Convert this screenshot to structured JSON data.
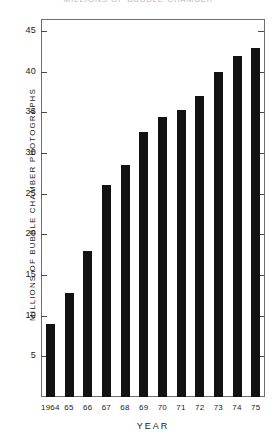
{
  "chart_data": {
    "type": "bar",
    "title": "MILLIONS OF BUBBLE CHAMBER",
    "xlabel": "YEAR",
    "ylabel": "MILLIONS OF BUBBLE CHAMBER PHOTOGRAPHS",
    "categories": [
      "1964",
      "65",
      "66",
      "67",
      "68",
      "69",
      "70",
      "71",
      "72",
      "73",
      "74",
      "75"
    ],
    "values": [
      9.0,
      12.8,
      17.9,
      26.1,
      28.6,
      32.6,
      34.4,
      35.3,
      37.0,
      40.0,
      41.9,
      42.9
    ],
    "ylim": [
      0,
      46.5
    ],
    "yticks": [
      5,
      10,
      15,
      20,
      25,
      30,
      35,
      40,
      45
    ],
    "ytick_labels": [
      "5",
      "10",
      "15",
      "20",
      "25",
      "30",
      "35",
      "40",
      "45"
    ],
    "grid": false,
    "legend": null,
    "bar_color": "#121212",
    "frame_color": "#6f6f6f"
  }
}
